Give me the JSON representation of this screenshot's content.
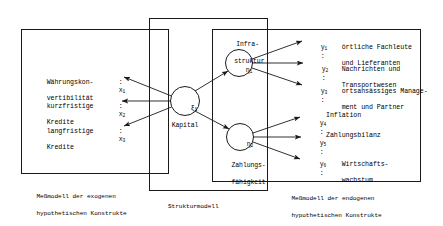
{
  "diagram": {
    "boxes": {
      "exogenous": {
        "caption_line1": "Meßmodell der exogenen",
        "caption_line2": "hypothetischen Konstrukte"
      },
      "structural": {
        "caption": "Strukturmodell"
      },
      "endogenous": {
        "caption_line1": "Meßmodell der endogenen",
        "caption_line2": "hypothetischen Konstrukte"
      }
    },
    "indicators_x": [
      {
        "name": "x",
        "index": "1",
        "colon": ":",
        "label_line1": "Währungskon-",
        "label_line2": "vertibilität"
      },
      {
        "name": "x",
        "index": "2",
        "colon": ":",
        "label_line1": "kurzfristige",
        "label_line2": "Kredite"
      },
      {
        "name": "x",
        "index": "3",
        "colon": ":",
        "label_line1": "langfristige",
        "label_line2": "Kredite"
      }
    ],
    "latent_exogenous": [
      {
        "glyph": "ξ",
        "index": "1",
        "label": "Kapital"
      }
    ],
    "latent_endogenous": [
      {
        "glyph": "η",
        "index": "1",
        "label_line1": "Infra-",
        "label_line2": "struktur"
      },
      {
        "glyph": "η",
        "index": "2",
        "label_line1": "Zahlungs-",
        "label_line2": "fähigkeit"
      }
    ],
    "indicators_y": [
      {
        "name": "y",
        "index": "1",
        "colon": ":",
        "label_line1": "örtliche Fachleute",
        "label_line2": "und Lieferanten"
      },
      {
        "name": "y",
        "index": "2",
        "colon": ":",
        "label_line1": "Nachrichten und",
        "label_line2": "Transportwesen"
      },
      {
        "name": "y",
        "index": "3",
        "colon": ":",
        "label_line1": "ortsansässiges Manage-",
        "label_line2": "ment und Partner"
      },
      {
        "name": "y",
        "index": "4",
        "colon": ":",
        "label_line1": "Inflation",
        "label_line2": ""
      },
      {
        "name": "y",
        "index": "5",
        "colon": ":",
        "label_line1": "Zahlungsbilanz",
        "label_line2": ""
      },
      {
        "name": "y",
        "index": "6",
        "colon": ":",
        "label_line1": "Wirtschafts-",
        "label_line2": "wachstum"
      }
    ],
    "colors": {
      "stroke": "#1a1a1a",
      "text": "#000000",
      "background": "#ffffff"
    }
  }
}
